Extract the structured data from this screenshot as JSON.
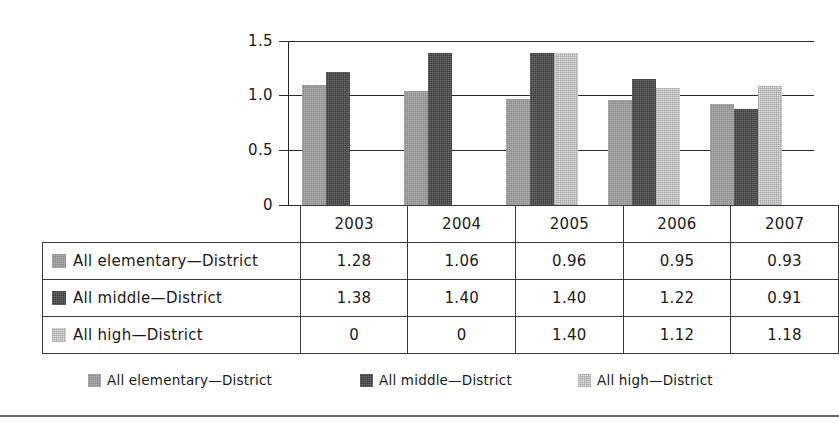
{
  "chart_data": {
    "type": "bar",
    "title": "",
    "subtitle": "",
    "xlabel": "",
    "ylabel": "",
    "categories": [
      "2003",
      "2004",
      "2005",
      "2006",
      "2007"
    ],
    "ylim": [
      0,
      1.5
    ],
    "ytick_labels": [
      "0",
      "0.5",
      "1.0",
      "1.5"
    ],
    "ytick_values": [
      0,
      0.5,
      1.0,
      1.5
    ],
    "grid": true,
    "legend_position": "bottom",
    "series": [
      {
        "name": "All elementary—District",
        "color": "#8b8b8b",
        "values": [
          1.28,
          1.06,
          0.96,
          0.95,
          0.93
        ],
        "plotted_heights": [
          1.1,
          1.04,
          0.97,
          0.96,
          0.92
        ]
      },
      {
        "name": "All middle—District",
        "color": "#3b3b3b",
        "values": [
          1.38,
          1.4,
          1.4,
          1.22,
          0.91
        ],
        "plotted_heights": [
          1.22,
          1.39,
          1.39,
          1.15,
          0.88
        ]
      },
      {
        "name": "All high—District",
        "color": "#dedede",
        "values": [
          0,
          0,
          1.4,
          1.12,
          1.18
        ],
        "plotted_heights": [
          0,
          0,
          1.39,
          1.07,
          1.09
        ]
      }
    ]
  },
  "table": {
    "header_row": [
      "2003",
      "2004",
      "2005",
      "2006",
      "2007"
    ],
    "rows": [
      {
        "label": "All elementary—District",
        "swatch": "series-swatch-elementary",
        "cells": [
          "1.28",
          "1.06",
          "0.96",
          "0.95",
          "0.93"
        ]
      },
      {
        "label": "All middle—District",
        "swatch": "series-swatch-middle",
        "cells": [
          "1.38",
          "1.40",
          "1.40",
          "1.22",
          "0.91"
        ]
      },
      {
        "label": "All high—District",
        "swatch": "series-swatch-high",
        "cells": [
          "0",
          "0",
          "1.40",
          "1.12",
          "1.18"
        ]
      }
    ]
  },
  "legend": {
    "items": [
      {
        "label": "All elementary—District",
        "color": "#8b8b8b"
      },
      {
        "label": "All middle—District",
        "color": "#3b3b3b"
      },
      {
        "label": "All high—District",
        "color": "#dedede"
      }
    ]
  },
  "axis": {
    "y_labels": [
      "1.5",
      "1.0",
      "0.5",
      "0"
    ]
  }
}
